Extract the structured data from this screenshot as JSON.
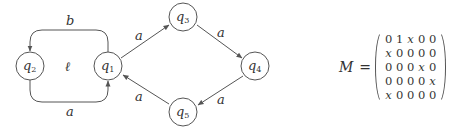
{
  "diagram": {
    "nodes": [
      {
        "id": "q1",
        "base": "q",
        "sub": "1",
        "cx": 108,
        "cy": 66
      },
      {
        "id": "q2",
        "base": "q",
        "sub": "2",
        "cx": 30,
        "cy": 66
      },
      {
        "id": "q3",
        "base": "q",
        "sub": "3",
        "cx": 183,
        "cy": 17
      },
      {
        "id": "q4",
        "base": "q",
        "sub": "4",
        "cx": 255,
        "cy": 66
      },
      {
        "id": "q5",
        "base": "q",
        "sub": "5",
        "cx": 183,
        "cy": 112
      }
    ],
    "edges": [
      {
        "from": "q1",
        "to": "q2",
        "label": "b"
      },
      {
        "from": "q2",
        "to": "q1",
        "label": "a"
      },
      {
        "from": "q1",
        "to": "q3",
        "label": "a"
      },
      {
        "from": "q3",
        "to": "q4",
        "label": "a"
      },
      {
        "from": "q4",
        "to": "q5",
        "label": "a"
      },
      {
        "from": "q5",
        "to": "q1",
        "label": "a"
      }
    ],
    "loop_label": "ℓ"
  },
  "matrix": {
    "name": "M",
    "equals": "=",
    "rows": [
      [
        "0",
        "1",
        "x",
        "0",
        "0"
      ],
      [
        "x",
        "0",
        "0",
        "0",
        "0"
      ],
      [
        "0",
        "0",
        "0",
        "x",
        "0"
      ],
      [
        "0",
        "0",
        "0",
        "0",
        "x"
      ],
      [
        "x",
        "0",
        "0",
        "0",
        "0"
      ]
    ]
  }
}
